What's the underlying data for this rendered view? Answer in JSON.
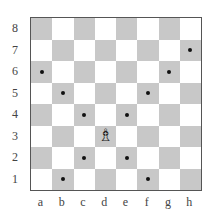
{
  "diagram": {
    "type": "chessboard",
    "ranks": [
      "8",
      "7",
      "6",
      "5",
      "4",
      "3",
      "2",
      "1"
    ],
    "files": [
      "a",
      "b",
      "c",
      "d",
      "e",
      "f",
      "g",
      "h"
    ],
    "colors": {
      "light": "#ffffff",
      "dark": "#c8c8c8",
      "dot": "#111111"
    },
    "pieces": [
      {
        "square": "d3",
        "piece": "white-bishop",
        "glyph": "♗"
      }
    ],
    "marked_squares": [
      "h7",
      "a6",
      "g6",
      "b5",
      "f5",
      "c4",
      "e4",
      "c2",
      "e2",
      "b1",
      "f1"
    ]
  }
}
